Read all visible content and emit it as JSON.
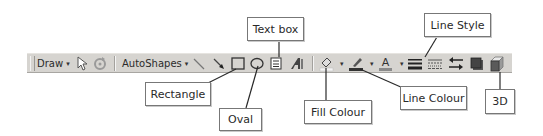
{
  "toolbar": {
    "draw_label": "Draw",
    "autoshapes_label": "AutoShapes",
    "dropdown_glyph": "▾",
    "items": [
      {
        "name": "select-objects",
        "icon": "cursor-arrow-icon"
      },
      {
        "name": "free-rotate",
        "icon": "rotate-icon"
      },
      {
        "name": "line",
        "icon": "line-icon"
      },
      {
        "name": "arrow",
        "icon": "arrow-icon"
      },
      {
        "name": "rectangle",
        "icon": "rectangle-icon"
      },
      {
        "name": "oval",
        "icon": "oval-icon"
      },
      {
        "name": "text-box",
        "icon": "text-box-icon"
      },
      {
        "name": "wordart",
        "icon": "wordart-icon"
      },
      {
        "name": "fill-colour",
        "icon": "paint-bucket-icon"
      },
      {
        "name": "line-colour",
        "icon": "pen-icon"
      },
      {
        "name": "font-colour",
        "icon": "font-color-icon",
        "glyph": "A"
      },
      {
        "name": "line-style",
        "icon": "line-style-icon"
      },
      {
        "name": "dash-style",
        "icon": "dash-style-icon"
      },
      {
        "name": "arrow-style",
        "icon": "arrow-style-icon"
      },
      {
        "name": "shadow",
        "icon": "shadow-icon"
      },
      {
        "name": "3d",
        "icon": "3d-cube-icon"
      }
    ]
  },
  "callouts": {
    "text_box": "Text box",
    "rectangle": "Rectangle",
    "oval": "Oval",
    "fill_colour": "Fill Colour",
    "line_colour": "Line Colour",
    "line_style": "Line Style",
    "three_d": "3D"
  },
  "colors": {
    "toolbar_bg": "#d6d4d0",
    "callout_border": "#777777",
    "leader_line": "#2a2a2a"
  }
}
